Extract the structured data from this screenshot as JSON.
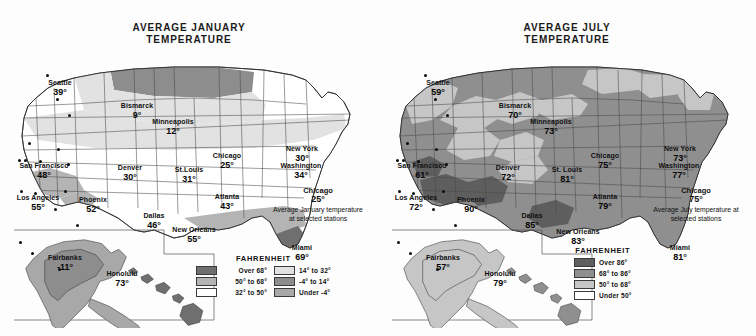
{
  "palette": {
    "over68": "#6f6f6f",
    "b50_68": "#b4b4b4",
    "b32_50": "#ffffff",
    "b14_32": "#e2e2e2",
    "bneg4_14": "#8d8d8d",
    "under_neg4": "#a8a8a8",
    "july_over86": "#5e5e5e",
    "july_68_86": "#8f8f8f",
    "july_50_68": "#c6c6c6",
    "july_under50": "#ffffff",
    "ink": "#111111",
    "outline": "#3a3a3a",
    "paper": "#fdfdfd"
  },
  "maps": [
    {
      "id": "january",
      "title_line1": "AVERAGE JANUARY",
      "title_line2": "TEMPERATURE",
      "annotation": {
        "city": "Chicago",
        "value": "25°",
        "description": "Average January temperature at selected stations"
      },
      "legend": {
        "title": "FAHRENHEIT",
        "columns": [
          [
            {
              "label": "Over 68°",
              "color": "#6f6f6f"
            },
            {
              "label": "50° to 68°",
              "color": "#b4b4b4"
            },
            {
              "label": "32° to 50°",
              "color": "#ffffff"
            }
          ],
          [
            {
              "label": "14° to 32°",
              "color": "#e2e2e2"
            },
            {
              "label": "-4° to 14°",
              "color": "#8d8d8d"
            },
            {
              "label": "Under -4°",
              "color": "#a8a8a8"
            }
          ]
        ]
      },
      "cities": [
        {
          "name": "Seattle",
          "value": "39°",
          "x": 46,
          "y": 21,
          "dx": 32,
          "dy": 16
        },
        {
          "name": "Bismarck",
          "value": "9°",
          "x": 123,
          "y": 44,
          "dx": 42,
          "dy": 40
        },
        {
          "name": "Minneapolis",
          "value": "12°",
          "x": 159,
          "y": 60,
          "dx": 54,
          "dy": 56
        },
        {
          "name": "Chicago",
          "value": "25°",
          "x": 213,
          "y": 94,
          "dx": 43,
          "dy": 90
        },
        {
          "name": "New York",
          "value": "30°",
          "x": 288,
          "y": 87,
          "dx": 14,
          "dy": 84
        },
        {
          "name": "Washington",
          "value": "34°",
          "x": 287,
          "y": 104,
          "dx": 10,
          "dy": 101
        },
        {
          "name": "San Francisco",
          "value": "48°",
          "x": 30,
          "y": 104,
          "dx": 4,
          "dy": 101
        },
        {
          "name": "Denver",
          "value": "30°",
          "x": 116,
          "y": 106,
          "dx": 25,
          "dy": 102
        },
        {
          "name": "St.Louis",
          "value": "31°",
          "x": 175,
          "y": 108,
          "dx": 53,
          "dy": 105
        },
        {
          "name": "Los Angeles",
          "value": "55°",
          "x": 24,
          "y": 136,
          "dx": 6,
          "dy": 132
        },
        {
          "name": "Phoenix",
          "value": "52°",
          "x": 79,
          "y": 138,
          "dx": 20,
          "dy": 134
        },
        {
          "name": "Atlanta",
          "value": "43°",
          "x": 213,
          "y": 135,
          "dx": 50,
          "dy": 132
        },
        {
          "name": "Dallas",
          "value": "46°",
          "x": 140,
          "y": 154,
          "dx": 40,
          "dy": 150
        },
        {
          "name": "New Orleans",
          "value": "55°",
          "x": 180,
          "y": 168,
          "dx": 62,
          "dy": 166
        },
        {
          "name": "Miami",
          "value": "69°",
          "x": 288,
          "y": 186,
          "dx": 5,
          "dy": 183
        },
        {
          "name": "Fairbanks",
          "value": "-11°",
          "x": 51,
          "y": 196,
          "dx": 17,
          "dy": 194
        },
        {
          "name": "Honolulu",
          "value": "73°",
          "x": 108,
          "y": 212,
          "dx": 44,
          "dy": 210
        }
      ]
    },
    {
      "id": "july",
      "title_line1": "AVERAGE JULY",
      "title_line2": "TEMPERATURE",
      "annotation": {
        "city": "Chicago",
        "value": "75°",
        "description": "Average July temperature at selected stations"
      },
      "legend": {
        "title": "FAHRENHEIT",
        "columns": [
          [
            {
              "label": "Over 86°",
              "color": "#5e5e5e"
            },
            {
              "label": "68° to 86°",
              "color": "#8f8f8f"
            },
            {
              "label": "50° to 68°",
              "color": "#c6c6c6"
            },
            {
              "label": "Under 50°",
              "color": "#ffffff"
            }
          ]
        ]
      },
      "cities": [
        {
          "name": "Seattle",
          "value": "59°",
          "x": 46,
          "y": 21,
          "dx": 32,
          "dy": 16
        },
        {
          "name": "Bismarck",
          "value": "70°",
          "x": 123,
          "y": 44,
          "dx": 42,
          "dy": 40
        },
        {
          "name": "Minneapolis",
          "value": "73°",
          "x": 159,
          "y": 60,
          "dx": 54,
          "dy": 56
        },
        {
          "name": "Chicago",
          "value": "75°",
          "x": 213,
          "y": 94,
          "dx": 43,
          "dy": 90
        },
        {
          "name": "New York",
          "value": "73°",
          "x": 288,
          "y": 87,
          "dx": 14,
          "dy": 84
        },
        {
          "name": "Washington",
          "value": "77°",
          "x": 287,
          "y": 104,
          "dx": 10,
          "dy": 101
        },
        {
          "name": "San Francisco",
          "value": "61°",
          "x": 30,
          "y": 104,
          "dx": 4,
          "dy": 101
        },
        {
          "name": "Denver",
          "value": "72°",
          "x": 116,
          "y": 106,
          "dx": 25,
          "dy": 102
        },
        {
          "name": "St. Louis",
          "value": "81°",
          "x": 175,
          "y": 108,
          "dx": 53,
          "dy": 105
        },
        {
          "name": "Los Angeles",
          "value": "72°",
          "x": 24,
          "y": 136,
          "dx": 6,
          "dy": 132
        },
        {
          "name": "Phoenix",
          "value": "90°",
          "x": 79,
          "y": 138,
          "dx": 20,
          "dy": 134
        },
        {
          "name": "Atlanta",
          "value": "79°",
          "x": 213,
          "y": 135,
          "dx": 50,
          "dy": 132
        },
        {
          "name": "Dallas",
          "value": "85°",
          "x": 140,
          "y": 154,
          "dx": 40,
          "dy": 150
        },
        {
          "name": "New Orleans",
          "value": "83°",
          "x": 186,
          "y": 170,
          "dx": 62,
          "dy": 166
        },
        {
          "name": "Miami",
          "value": "81°",
          "x": 288,
          "y": 186,
          "dx": 5,
          "dy": 183
        },
        {
          "name": "Fairbanks",
          "value": "57°",
          "x": 51,
          "y": 196,
          "dx": 17,
          "dy": 194
        },
        {
          "name": "Honolulu",
          "value": "79°",
          "x": 108,
          "y": 212,
          "dx": 44,
          "dy": 210
        }
      ]
    }
  ],
  "chart_data": {
    "type": "map",
    "unit": "Fahrenheit",
    "series": [
      {
        "name": "Average January Temperature",
        "legend_bins": [
          "Over 68°",
          "50° to 68°",
          "32° to 50°",
          "14° to 32°",
          "-4° to 14°",
          "Under -4°"
        ],
        "stations": [
          {
            "city": "Seattle",
            "value": 39
          },
          {
            "city": "Bismarck",
            "value": 9
          },
          {
            "city": "Minneapolis",
            "value": 12
          },
          {
            "city": "Chicago",
            "value": 25
          },
          {
            "city": "New York",
            "value": 30
          },
          {
            "city": "Washington",
            "value": 34
          },
          {
            "city": "San Francisco",
            "value": 48
          },
          {
            "city": "Denver",
            "value": 30
          },
          {
            "city": "St. Louis",
            "value": 31
          },
          {
            "city": "Los Angeles",
            "value": 55
          },
          {
            "city": "Phoenix",
            "value": 52
          },
          {
            "city": "Atlanta",
            "value": 43
          },
          {
            "city": "Dallas",
            "value": 46
          },
          {
            "city": "New Orleans",
            "value": 55
          },
          {
            "city": "Miami",
            "value": 69
          },
          {
            "city": "Fairbanks",
            "value": -11
          },
          {
            "city": "Honolulu",
            "value": 73
          }
        ]
      },
      {
        "name": "Average July Temperature",
        "legend_bins": [
          "Over 86°",
          "68° to 86°",
          "50° to 68°",
          "Under 50°"
        ],
        "stations": [
          {
            "city": "Seattle",
            "value": 59
          },
          {
            "city": "Bismarck",
            "value": 70
          },
          {
            "city": "Minneapolis",
            "value": 73
          },
          {
            "city": "Chicago",
            "value": 75
          },
          {
            "city": "New York",
            "value": 73
          },
          {
            "city": "Washington",
            "value": 77
          },
          {
            "city": "San Francisco",
            "value": 61
          },
          {
            "city": "Denver",
            "value": 72
          },
          {
            "city": "St. Louis",
            "value": 81
          },
          {
            "city": "Los Angeles",
            "value": 72
          },
          {
            "city": "Phoenix",
            "value": 90
          },
          {
            "city": "Atlanta",
            "value": 79
          },
          {
            "city": "Dallas",
            "value": 85
          },
          {
            "city": "New Orleans",
            "value": 83
          },
          {
            "city": "Miami",
            "value": 81
          },
          {
            "city": "Fairbanks",
            "value": 57
          },
          {
            "city": "Honolulu",
            "value": 79
          }
        ]
      }
    ]
  }
}
